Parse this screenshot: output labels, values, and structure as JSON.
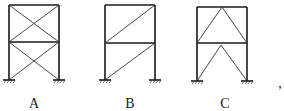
{
  "figure": {
    "type": "structural frames with bracing",
    "frames": [
      {
        "id": "A",
        "label": "A",
        "bracing": "X-bracing in both stories",
        "stories": 2,
        "supports": "fixed"
      },
      {
        "id": "B",
        "label": "B",
        "bracing": "single diagonal in each story (bottom-left to top-right)",
        "stories": 2,
        "supports": "fixed"
      },
      {
        "id": "C",
        "label": "C",
        "bracing": "inverted-V (chevron) bracing in both stories",
        "stories": 2,
        "supports": "fixed"
      }
    ],
    "trailing_punctuation": ","
  },
  "colors": {
    "line": "#1a1a1a",
    "background": "#ffffff"
  }
}
